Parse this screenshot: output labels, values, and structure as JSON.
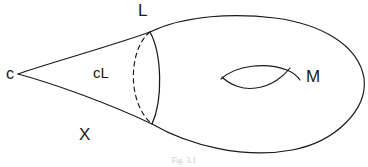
{
  "figure": {
    "caption": "Fig. 3.1",
    "background_color": "#ffffff",
    "stroke_color": "#1a1a1a",
    "labels": [
      {
        "id": "cone-point",
        "text": "c",
        "x": 6,
        "y": 66
      },
      {
        "id": "link",
        "text": "L",
        "x": 138,
        "y": 2
      },
      {
        "id": "cone-cL",
        "text": "cL",
        "x": 93,
        "y": 65
      },
      {
        "id": "space-X",
        "text": "X",
        "x": 79,
        "y": 126
      },
      {
        "id": "manifold-M",
        "text": "M",
        "x": 306,
        "y": 68
      }
    ],
    "geometry": {
      "cone_apex": {
        "x": 18,
        "y": 74
      },
      "junction_top": {
        "x": 150,
        "y": 32
      },
      "junction_bottom": {
        "x": 152,
        "y": 124
      },
      "body_right_extent": {
        "x": 365,
        "y": 80
      },
      "cross_section_solid_bulge_x": 163,
      "cross_section_dashed_bulge_x": 127,
      "handle_span": {
        "x1": 220,
        "x2": 300,
        "y1": 66,
        "y2": 88
      }
    }
  }
}
